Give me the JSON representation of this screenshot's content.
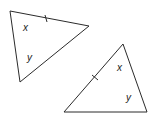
{
  "diagram": {
    "stroke_color": "#2b2b2b",
    "triangles": [
      {
        "vertices": [
          [
            10,
            11
          ],
          [
            89,
            26
          ],
          [
            20,
            82
          ]
        ],
        "tick": {
          "x1": 45,
          "y1": 15,
          "x2": 47,
          "y2": 22
        },
        "labels": [
          {
            "text": "x",
            "x": 23,
            "y": 31
          },
          {
            "text": "y",
            "x": 27,
            "y": 61
          }
        ]
      },
      {
        "vertices": [
          [
            123,
            44
          ],
          [
            64,
            112
          ],
          [
            147,
            112
          ]
        ],
        "tick": {
          "x1": 92,
          "y1": 75,
          "x2": 98,
          "y2": 80
        },
        "labels": [
          {
            "text": "x",
            "x": 117,
            "y": 71
          },
          {
            "text": "y",
            "x": 126,
            "y": 101
          }
        ]
      }
    ]
  }
}
